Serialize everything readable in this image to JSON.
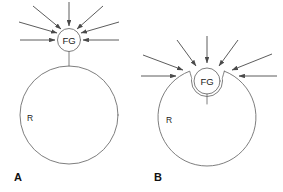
{
  "figure": {
    "background_color": "#ffffff",
    "outline_color": "#6f6f6f",
    "arrow_color": "#4a4a4a",
    "text_color": "#222222"
  },
  "panels": [
    {
      "id": "A",
      "label": "A",
      "label_x": 18,
      "label_y": 177,
      "cell": {
        "label": "R",
        "label_x": 30,
        "label_y": 118,
        "cx": 69,
        "cy": 115,
        "r": 49,
        "shape": "circle"
      },
      "organelle": {
        "label": "FG",
        "label_x": 69,
        "label_y": 40,
        "cx": 69,
        "cy": 40,
        "r": 11.5
      },
      "stem": {
        "x1": 69,
        "y1": 51.5,
        "x2": 69,
        "y2": 66
      },
      "arrows": [
        {
          "x1": 20,
          "y1": 40,
          "x2": 55,
          "y2": 40
        },
        {
          "x1": 19,
          "y1": 22,
          "x2": 57,
          "y2": 33
        },
        {
          "x1": 33,
          "y1": 6,
          "x2": 61,
          "y2": 29
        },
        {
          "x1": 69,
          "y1": 2,
          "x2": 69,
          "y2": 26
        },
        {
          "x1": 103,
          "y1": 6,
          "x2": 77,
          "y2": 29
        },
        {
          "x1": 119,
          "y1": 22,
          "x2": 81,
          "y2": 33
        },
        {
          "x1": 119,
          "y1": 40,
          "x2": 83,
          "y2": 40
        }
      ]
    },
    {
      "id": "B",
      "label": "B",
      "label_x": 158,
      "label_y": 177,
      "cell": {
        "label": "R",
        "label_x": 169,
        "label_y": 120,
        "cx": 207,
        "cy": 117,
        "r": 49,
        "shape": "circle-with-notch"
      },
      "organelle": {
        "label": "FG",
        "label_x": 207,
        "label_y": 81,
        "cx": 207,
        "cy": 81,
        "r": 13
      },
      "stem": {
        "x1": 207,
        "y1": 94,
        "x2": 207,
        "y2": 104
      },
      "notch": {
        "left_rim_x": 190,
        "right_rim_x": 224,
        "rim_y": 72,
        "depth_y": 98
      },
      "arrows": [
        {
          "x1": 141,
          "y1": 76,
          "x2": 176,
          "y2": 76
        },
        {
          "x1": 143,
          "y1": 55,
          "x2": 183,
          "y2": 70
        },
        {
          "x1": 177,
          "y1": 40,
          "x2": 196,
          "y2": 66
        },
        {
          "x1": 207,
          "y1": 36,
          "x2": 207,
          "y2": 63
        },
        {
          "x1": 238,
          "y1": 40,
          "x2": 219,
          "y2": 66
        },
        {
          "x1": 272,
          "y1": 54,
          "x2": 232,
          "y2": 70
        },
        {
          "x1": 277,
          "y1": 76,
          "x2": 239,
          "y2": 76
        }
      ]
    }
  ]
}
